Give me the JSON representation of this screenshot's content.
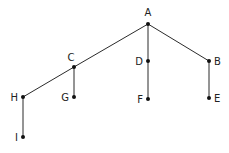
{
  "diagram": {
    "type": "tree",
    "width": 229,
    "height": 153,
    "colors": {
      "edge": "#2b2b2b",
      "node": "#111111",
      "label": "#222222"
    },
    "nodes": [
      {
        "id": "A",
        "label": "A",
        "x": 148,
        "y": 24,
        "lx": 148,
        "ly": 16,
        "anchor": "middle"
      },
      {
        "id": "B",
        "label": "B",
        "x": 209,
        "y": 61,
        "lx": 214,
        "ly": 65,
        "anchor": "start"
      },
      {
        "id": "C",
        "label": "C",
        "x": 74,
        "y": 67,
        "lx": 71,
        "ly": 61,
        "anchor": "middle"
      },
      {
        "id": "D",
        "label": "D",
        "x": 148,
        "y": 61,
        "lx": 143,
        "ly": 65,
        "anchor": "end"
      },
      {
        "id": "E",
        "label": "E",
        "x": 209,
        "y": 98,
        "lx": 214,
        "ly": 102,
        "anchor": "start"
      },
      {
        "id": "F",
        "label": "F",
        "x": 148,
        "y": 99,
        "lx": 143,
        "ly": 103,
        "anchor": "end"
      },
      {
        "id": "G",
        "label": "G",
        "x": 74,
        "y": 97,
        "lx": 69,
        "ly": 101,
        "anchor": "end"
      },
      {
        "id": "H",
        "label": "H",
        "x": 23,
        "y": 97,
        "lx": 18,
        "ly": 101,
        "anchor": "end"
      },
      {
        "id": "I",
        "label": "I",
        "x": 23,
        "y": 137,
        "lx": 18,
        "ly": 141,
        "anchor": "end"
      }
    ],
    "edges": [
      {
        "from": "A",
        "to": "B"
      },
      {
        "from": "A",
        "to": "C"
      },
      {
        "from": "A",
        "to": "D"
      },
      {
        "from": "D",
        "to": "F"
      },
      {
        "from": "B",
        "to": "E"
      },
      {
        "from": "C",
        "to": "G"
      },
      {
        "from": "C",
        "to": "H"
      },
      {
        "from": "H",
        "to": "I"
      }
    ]
  }
}
